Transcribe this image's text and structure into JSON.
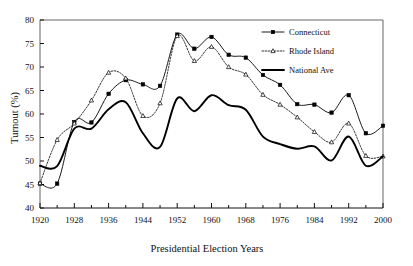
{
  "chart_data": {
    "type": "line",
    "title": "",
    "xlabel": "Presidential Election Years",
    "ylabel": "Turnout (%)",
    "xlim": [
      1920,
      2000
    ],
    "ylim": [
      40,
      80
    ],
    "ytick_step": 5,
    "xtick_step": 8,
    "xminor_step": 4,
    "grid": false,
    "legend_position": "top-right",
    "x": [
      1920,
      1924,
      1928,
      1932,
      1936,
      1940,
      1944,
      1948,
      1952,
      1956,
      1960,
      1964,
      1968,
      1972,
      1976,
      1980,
      1984,
      1988,
      1992,
      1996,
      2000
    ],
    "xtick_labels": [
      "1920",
      "1928",
      "1936",
      "1944",
      "1952",
      "1960",
      "1968",
      "1976",
      "1984",
      "1992",
      "2000"
    ],
    "ytick_labels": [
      "40",
      "45",
      "50",
      "55",
      "60",
      "65",
      "70",
      "75",
      "80"
    ],
    "series": [
      {
        "name": "Connecticut",
        "marker": "square",
        "line": "solid",
        "color": "#000000",
        "values": [
          45.2,
          45.2,
          58.3,
          58.2,
          64.3,
          67.2,
          66.3,
          66.0,
          76.9,
          73.9,
          76.4,
          72.6,
          72.0,
          68.3,
          66.2,
          62.1,
          62.0,
          60.3,
          64.0,
          55.9,
          57.5
        ]
      },
      {
        "name": "Rhode Island",
        "marker": "triangle",
        "line": "dotted",
        "color": "#000000",
        "values": [
          45.3,
          54.5,
          58.0,
          62.9,
          68.8,
          67.6,
          59.6,
          62.3,
          76.6,
          71.3,
          74.3,
          70.0,
          68.4,
          64.1,
          62.0,
          59.3,
          56.2,
          54.0,
          58.0,
          51.1,
          51.0
        ]
      },
      {
        "name": "National Ave",
        "marker": "none",
        "line": "solid-thick",
        "color": "#000000",
        "values": [
          49.0,
          48.9,
          56.9,
          56.9,
          61.0,
          62.5,
          55.9,
          53.0,
          63.3,
          60.6,
          64.0,
          61.9,
          60.9,
          55.2,
          53.6,
          52.6,
          53.1,
          50.1,
          55.2,
          49.0,
          51.0
        ]
      }
    ]
  },
  "legend": {
    "items": [
      {
        "label": "Connecticut"
      },
      {
        "label": "Rhode Island"
      },
      {
        "label": "National Ave"
      }
    ]
  }
}
